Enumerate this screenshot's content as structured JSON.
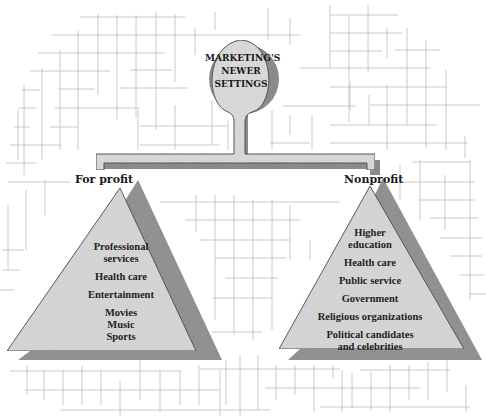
{
  "diagram": {
    "center": {
      "title_lines": [
        "MARKETING'S",
        "NEWER",
        "SETTINGS"
      ]
    },
    "branches": [
      {
        "label": "For profit",
        "items": [
          {
            "lines": [
              "Professional",
              "services"
            ]
          },
          {
            "lines": [
              "Health care"
            ]
          },
          {
            "lines": [
              "Entertainment"
            ]
          },
          {
            "lines": [
              "Movies",
              "Music",
              "Sports"
            ]
          }
        ]
      },
      {
        "label": "Nonprofit",
        "items": [
          {
            "lines": [
              "Higher",
              "education"
            ]
          },
          {
            "lines": [
              "Health care"
            ]
          },
          {
            "lines": [
              "Public service"
            ]
          },
          {
            "lines": [
              "Government"
            ]
          },
          {
            "lines": [
              "Religious organizations"
            ]
          },
          {
            "lines": [
              "Political candidates",
              "and celebrities"
            ]
          }
        ]
      }
    ]
  },
  "colors": {
    "shape_fill": "#d4d4d4",
    "shape_stroke": "#3a3a3a",
    "shadow": "#8a8a8a",
    "grid": "#b8b8b8",
    "text": "#1a1a1a"
  }
}
